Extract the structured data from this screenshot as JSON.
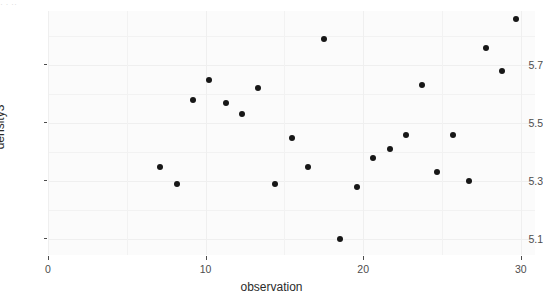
{
  "top_artifact": {
    "text": "·  ·   ··"
  },
  "axes": {
    "x_title": "observation",
    "y_title": "density3",
    "x_ticks": [
      "0",
      "10",
      "20",
      "30"
    ],
    "y_ticks": [
      "5.7",
      "5.5",
      "5.3",
      "5.1"
    ]
  },
  "chart_data": {
    "type": "scatter",
    "title": "",
    "xlabel": "observation",
    "ylabel": "density3",
    "xlim": [
      0,
      30.9
    ],
    "ylim": [
      5.045,
      5.887
    ],
    "xticks": [
      0,
      10,
      20,
      30
    ],
    "yticks": [
      5.1,
      5.3,
      5.5,
      5.7
    ],
    "grid": true,
    "legend": "none",
    "point_color": "#171717",
    "panel_color": "#fbfbfb",
    "gridline_color": "#f0f0f0",
    "series": [
      {
        "name": "density3",
        "x": [
          7.1,
          8.2,
          9.2,
          10.2,
          11.3,
          12.3,
          13.3,
          14.4,
          15.5,
          16.5,
          17.5,
          18.5,
          19.6,
          20.6,
          21.7,
          22.7,
          23.7,
          24.7,
          25.7,
          26.7,
          27.8,
          28.8,
          29.7
        ],
        "y": [
          5.35,
          5.29,
          5.58,
          5.65,
          5.57,
          5.53,
          5.62,
          5.29,
          5.45,
          5.35,
          5.79,
          5.1,
          5.28,
          5.38,
          5.41,
          5.46,
          5.63,
          5.33,
          5.46,
          5.3,
          5.76,
          5.68,
          5.86
        ]
      }
    ]
  }
}
